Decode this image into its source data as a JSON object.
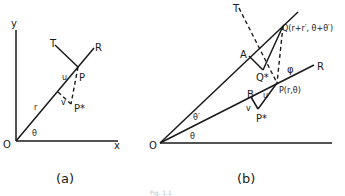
{
  "figure": {
    "caption_partial": "Fig. 1.1",
    "panel_a": {
      "label": "(a)",
      "points": {
        "origin": "O",
        "P": "P",
        "P_star": "P*",
        "T": "T",
        "R": "R"
      },
      "axes": {
        "x": "x",
        "y": "y"
      },
      "annotations": {
        "r": "r",
        "u": "u",
        "v": "v",
        "theta": "θ"
      }
    },
    "panel_b": {
      "label": "(b)",
      "points": {
        "origin": "O",
        "P": "P(r,θ)",
        "Q": "Q(r+r′, θ+θ′)",
        "P_star": "P*",
        "Q_star": "Q*",
        "A": "A",
        "B": "B",
        "T": "T",
        "R": "R"
      },
      "annotations": {
        "u": "u",
        "v": "v",
        "theta": "θ",
        "theta_prime": "θ′",
        "phi": "φ"
      }
    }
  }
}
